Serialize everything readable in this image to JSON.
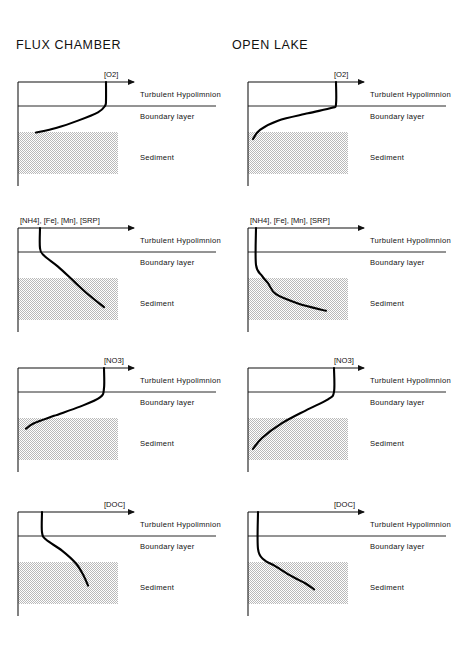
{
  "figure": {
    "columns": [
      {
        "id": "flux-chamber",
        "title": "FLUX CHAMBER"
      },
      {
        "id": "open-lake",
        "title": "OPEN LAKE"
      }
    ],
    "zone_labels": {
      "hypolimnion": "Turbulent  Hypolimnion",
      "boundary": "Boundary  layer",
      "sediment": "Sediment"
    },
    "rows": [
      {
        "id": "o2",
        "axis_label": "[O2]"
      },
      {
        "id": "reduced",
        "axis_label": "[NH4], [Fe], [Mn], [SRP]"
      },
      {
        "id": "no3",
        "axis_label": "[NO3]"
      },
      {
        "id": "doc",
        "axis_label": "[DOC]"
      }
    ]
  },
  "chart_data": {
    "type": "line",
    "xlabel": "Concentration (increasing to the right)",
    "ylabel": "Depth (increasing downward)",
    "grid": false,
    "legend": "none",
    "axis_ranges": {
      "x": [
        0,
        100
      ],
      "y_depth": [
        0,
        100
      ]
    },
    "zone_boundaries": {
      "hypolimnion_top": 0,
      "boundary_layer_top": 26,
      "sediment_top": 55,
      "bottom": 100
    },
    "panels": [
      {
        "column": "FLUX CHAMBER",
        "species": "[O2]",
        "description": "Oxygen high and uniform in chamber water, declining linearly through the boundary layer to near zero at the sediment surface",
        "points": [
          {
            "depth": 0,
            "conc": 88
          },
          {
            "depth": 20,
            "conc": 88
          },
          {
            "depth": 26,
            "conc": 87
          },
          {
            "depth": 33,
            "conc": 80
          },
          {
            "depth": 42,
            "conc": 60
          },
          {
            "depth": 50,
            "conc": 38
          },
          {
            "depth": 55,
            "conc": 18
          }
        ]
      },
      {
        "column": "OPEN LAKE",
        "species": "[O2]",
        "description": "Oxygen uniform through the hypolimnion, with a sharp drop confined to the thin boundary layer just above the sediment",
        "points": [
          {
            "depth": 0,
            "conc": 88
          },
          {
            "depth": 24,
            "conc": 88
          },
          {
            "depth": 28,
            "conc": 84
          },
          {
            "depth": 34,
            "conc": 60
          },
          {
            "depth": 42,
            "conc": 30
          },
          {
            "depth": 52,
            "conc": 12
          },
          {
            "depth": 62,
            "conc": 5
          }
        ]
      },
      {
        "column": "FLUX CHAMBER",
        "species": "[NH4], [Fe], [Mn], [SRP]",
        "description": "Reduced solutes low in chamber water, increasing progressively with depth through the boundary layer into the sediment",
        "points": [
          {
            "depth": 0,
            "conc": 22
          },
          {
            "depth": 22,
            "conc": 22
          },
          {
            "depth": 30,
            "conc": 26
          },
          {
            "depth": 42,
            "conc": 40
          },
          {
            "depth": 58,
            "conc": 56
          },
          {
            "depth": 72,
            "conc": 70
          },
          {
            "depth": 86,
            "conc": 86
          }
        ]
      },
      {
        "column": "OPEN LAKE",
        "species": "[NH4], [Fe], [Mn], [SRP]",
        "description": "Reduced solutes near zero in the hypolimnion, rising steeply only within the sediment",
        "points": [
          {
            "depth": 0,
            "conc": 8
          },
          {
            "depth": 40,
            "conc": 8
          },
          {
            "depth": 52,
            "conc": 14
          },
          {
            "depth": 60,
            "conc": 20
          },
          {
            "depth": 72,
            "conc": 28
          },
          {
            "depth": 82,
            "conc": 50
          },
          {
            "depth": 90,
            "conc": 78
          }
        ]
      },
      {
        "column": "FLUX CHAMBER",
        "species": "[NO3]",
        "description": "Nitrate high in chamber water, decreasing through the boundary layer to near zero at the sediment surface",
        "points": [
          {
            "depth": 0,
            "conc": 86
          },
          {
            "depth": 22,
            "conc": 86
          },
          {
            "depth": 32,
            "conc": 82
          },
          {
            "depth": 42,
            "conc": 62
          },
          {
            "depth": 52,
            "conc": 36
          },
          {
            "depth": 60,
            "conc": 16
          },
          {
            "depth": 66,
            "conc": 8
          }
        ]
      },
      {
        "column": "OPEN LAKE",
        "species": "[NO3]",
        "description": "Nitrate uniform through the hypolimnion, consumed within the upper sediment with a gradual decline",
        "points": [
          {
            "depth": 0,
            "conc": 86
          },
          {
            "depth": 26,
            "conc": 86
          },
          {
            "depth": 34,
            "conc": 80
          },
          {
            "depth": 46,
            "conc": 58
          },
          {
            "depth": 60,
            "conc": 34
          },
          {
            "depth": 76,
            "conc": 14
          },
          {
            "depth": 88,
            "conc": 5
          }
        ]
      },
      {
        "column": "FLUX CHAMBER",
        "species": "[DOC]",
        "description": "Dissolved organic carbon low in chamber water, increasing through the boundary layer into the sediment",
        "points": [
          {
            "depth": 0,
            "conc": 24
          },
          {
            "depth": 22,
            "conc": 24
          },
          {
            "depth": 30,
            "conc": 28
          },
          {
            "depth": 42,
            "conc": 44
          },
          {
            "depth": 56,
            "conc": 58
          },
          {
            "depth": 70,
            "conc": 66
          },
          {
            "depth": 80,
            "conc": 70
          }
        ]
      },
      {
        "column": "OPEN LAKE",
        "species": "[DOC]",
        "description": "Dissolved organic carbon near zero in the hypolimnion, increasing only at depth within the sediment",
        "points": [
          {
            "depth": 0,
            "conc": 10
          },
          {
            "depth": 40,
            "conc": 10
          },
          {
            "depth": 52,
            "conc": 16
          },
          {
            "depth": 58,
            "conc": 26
          },
          {
            "depth": 70,
            "conc": 44
          },
          {
            "depth": 78,
            "conc": 58
          },
          {
            "depth": 84,
            "conc": 66
          }
        ]
      }
    ]
  },
  "colors": {
    "ink": "#111111",
    "curve": "#000000",
    "sediment": "#e2e2e2",
    "background": "#ffffff"
  }
}
